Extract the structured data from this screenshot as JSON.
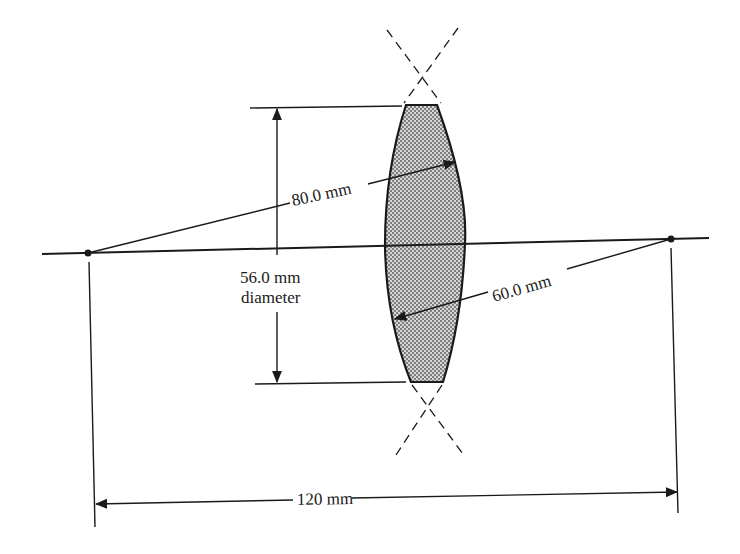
{
  "diagram": {
    "type": "thick-lens-cross-section",
    "background": "#ffffff",
    "ink_color": "#1a1a1a",
    "lens_fill": "#c9c9c9",
    "labels": {
      "radius_left_surface": "80.0 mm",
      "radius_right_surface": "60.0 mm",
      "diameter_value": "56.0 mm",
      "diameter_word": "diameter",
      "center_separation": "120 mm"
    },
    "elements": {
      "optical_axis": {
        "x1": 42,
        "y1": 254,
        "x2": 709,
        "y2": 238
      },
      "center_of_curvature_left": {
        "x": 88,
        "y": 253
      },
      "center_of_curvature_right": {
        "x": 671,
        "y": 239
      },
      "lens": {
        "top_flat": {
          "x1": 406,
          "y1": 105,
          "x2": 437,
          "y2": 105
        },
        "bottom_flat": {
          "x1": 411,
          "y1": 382,
          "x2": 443,
          "y2": 382
        },
        "left_vertex": {
          "x": 385,
          "y": 245
        },
        "right_vertex": {
          "x": 465,
          "y": 243
        }
      },
      "diameter_dimension": {
        "x": 277,
        "y_top": 107,
        "y_bottom": 383
      },
      "separation_dimension": {
        "x1": 95,
        "y1": 504,
        "x2": 678,
        "y2": 492
      }
    }
  }
}
